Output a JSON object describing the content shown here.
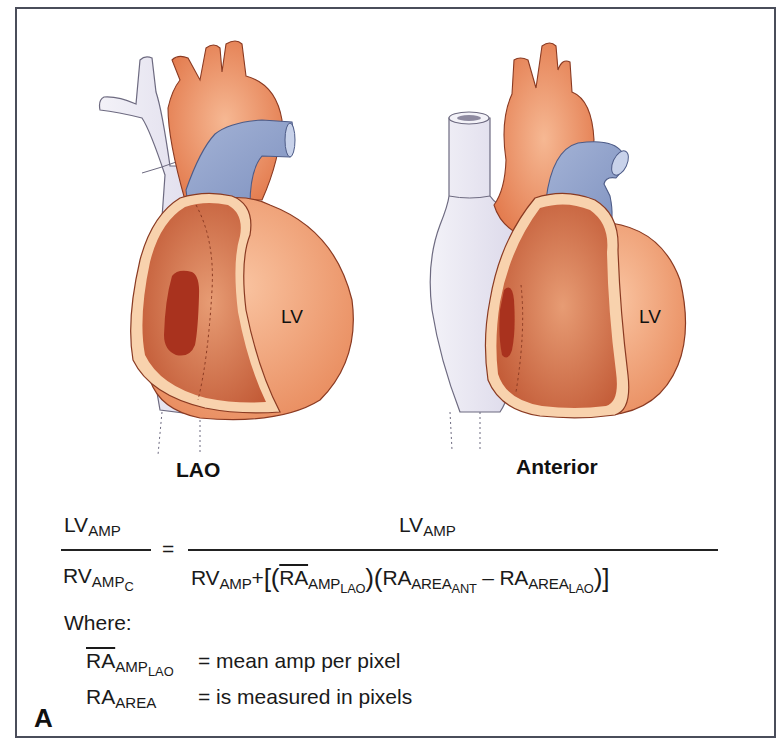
{
  "figure": {
    "panel_letter": "A",
    "views": [
      {
        "name": "LAO",
        "chamber_label": "LV"
      },
      {
        "name": "Anterior",
        "chamber_label": "LV"
      }
    ],
    "colors": {
      "frame": "#4a4d5a",
      "aorta": "#e98a5e",
      "ventricle_outer": "#f2a878",
      "atrium_inner": "#c9623c",
      "atrium_rim": "#f7cfa5",
      "atrium_dark": "#a8321e",
      "pulmonary_artery": "#8fa0c8",
      "vena_cava": "#e4e2ee"
    }
  },
  "formula": {
    "lhs_num": {
      "base": "LV",
      "sub": "AMP"
    },
    "lhs_den": {
      "base": "RV",
      "sub": "AMP",
      "subsub": "C"
    },
    "equals": "=",
    "rhs_num": {
      "base": "LV",
      "sub": "AMP"
    },
    "rhs_den": {
      "t1_base": "RV",
      "t1_sub": "AMP",
      "plus": "+",
      "open": "[(",
      "t2_base": "RA",
      "t2_sub": "AMP",
      "t2_subsub": "LAO",
      "mid": ")(",
      "t3_base": "RA",
      "t3_sub": "AREA",
      "t3_subsub": "ANT",
      "minus": " – ",
      "t4_base": "RA",
      "t4_sub": "AREA",
      "t4_subsub": "LAO",
      "close": ")]"
    }
  },
  "where": {
    "label": "Where:",
    "definitions": [
      {
        "base": "RA",
        "sub": "AMP",
        "subsub": "LAO",
        "text": "= mean amp per pixel"
      },
      {
        "base": "RA",
        "sub": "AREA",
        "subsub": "",
        "text": "= is measured in pixels"
      }
    ]
  }
}
